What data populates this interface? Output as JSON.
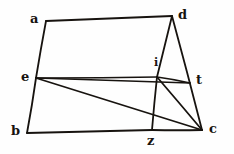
{
  "figure": {
    "kind": "geometry-diagram",
    "background_color": "#fefefe",
    "ink_color": "#17130f",
    "canvas": {
      "width": 234,
      "height": 154
    },
    "points": [
      {
        "id": "a",
        "label": "a",
        "x": 46,
        "y": 21,
        "label_x": 30,
        "label_y": 12,
        "label_size": "normal"
      },
      {
        "id": "d",
        "label": "d",
        "x": 172,
        "y": 16,
        "label_x": 178,
        "label_y": 8,
        "label_size": "normal"
      },
      {
        "id": "e",
        "label": "e",
        "x": 36,
        "y": 78,
        "label_x": 21,
        "label_y": 70,
        "label_size": "normal"
      },
      {
        "id": "i",
        "label": "i",
        "x": 157,
        "y": 77,
        "label_x": 154,
        "label_y": 57,
        "label_size": "small"
      },
      {
        "id": "t",
        "label": "t",
        "x": 190,
        "y": 83,
        "label_x": 196,
        "label_y": 73,
        "label_size": "normal"
      },
      {
        "id": "b",
        "label": "b",
        "x": 27,
        "y": 133,
        "label_x": 11,
        "label_y": 124,
        "label_size": "normal"
      },
      {
        "id": "z",
        "label": "z",
        "x": 152,
        "y": 130,
        "label_x": 147,
        "label_y": 134,
        "label_size": "normal"
      },
      {
        "id": "c",
        "label": "c",
        "x": 202,
        "y": 130,
        "label_x": 209,
        "label_y": 122,
        "label_size": "normal"
      }
    ],
    "segments": [
      {
        "id": "a-d",
        "from": "a",
        "to": "d",
        "width": 1.8
      },
      {
        "id": "a-e",
        "from": "a",
        "to": "e",
        "width": 1.8
      },
      {
        "id": "e-b",
        "from": "e",
        "to": "b",
        "width": 1.8
      },
      {
        "id": "b-z",
        "from": "b",
        "to": "z",
        "width": 1.8
      },
      {
        "id": "z-c",
        "from": "z",
        "to": "c",
        "width": 1.8
      },
      {
        "id": "d-c",
        "from": "d",
        "to": "c",
        "width": 1.8
      },
      {
        "id": "d-i",
        "from": "d",
        "to": "i",
        "width": 1.8
      },
      {
        "id": "e-i",
        "from": "e",
        "to": "i",
        "width": 1.6
      },
      {
        "id": "e-t",
        "from": "e",
        "to": "t",
        "width": 1.6
      },
      {
        "id": "e-c",
        "from": "e",
        "to": "c",
        "width": 1.8
      },
      {
        "id": "i-t",
        "from": "i",
        "to": "t",
        "width": 1.6
      },
      {
        "id": "i-c",
        "from": "i",
        "to": "c",
        "width": 1.8
      },
      {
        "id": "i-z",
        "from": "i",
        "to": "z",
        "width": 1.8
      }
    ]
  }
}
